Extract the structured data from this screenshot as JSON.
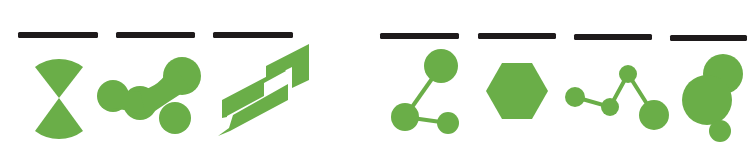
{
  "colors": {
    "background": "#ffffff",
    "bar": "#1e1a1b",
    "icon_fill": "#6aae48"
  },
  "groups": [
    {
      "name": "left-group",
      "items": [
        {
          "icon": "hourglass-sectors-icon",
          "bar": {
            "x": 18,
            "w": 80
          }
        },
        {
          "icon": "blob-chain-icon",
          "bar": {
            "x": 116,
            "w": 79
          }
        },
        {
          "icon": "layered-strips-icon",
          "bar": {
            "x": 213,
            "w": 80
          }
        }
      ]
    },
    {
      "name": "right-group",
      "items": [
        {
          "icon": "molecule-icon",
          "bar": {
            "x": 380,
            "w": 79
          }
        },
        {
          "icon": "hexagon-icon",
          "bar": {
            "x": 478,
            "w": 78
          }
        },
        {
          "icon": "node-chain-icon",
          "bar": {
            "x": 574,
            "w": 78
          }
        },
        {
          "icon": "circle-cluster-icon",
          "bar": {
            "x": 670,
            "w": 77
          }
        }
      ]
    }
  ]
}
